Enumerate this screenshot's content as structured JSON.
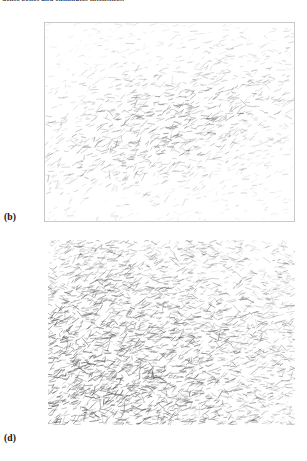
{
  "figure": {
    "caption_top": "dense zones and eliminates intensities.",
    "background_color": "#ffffff",
    "ink_color": "#555555",
    "border_color": "#c9c9c9"
  },
  "panels": [
    {
      "key": "b",
      "label": "(b)",
      "bordered": true,
      "x": 44,
      "y": 22,
      "width": 251,
      "height": 200
    },
    {
      "key": "d",
      "label": "(d)",
      "bordered": false,
      "x": 48,
      "y": 240,
      "width": 247,
      "height": 185
    }
  ],
  "chart_data": [
    {
      "id": "panel-b",
      "type": "scatter",
      "title": "(b)",
      "xlabel": "",
      "ylabel": "",
      "grid": false,
      "legend": null,
      "glyph": "line-segment",
      "description": "Sparse quiver / vector field of short line segments on white, faint grey ink, with an elongated denser and darker diagonal band running from lower-left to upper-right through the centre of the frame.",
      "xlim": [
        0,
        251
      ],
      "ylim": [
        0,
        200
      ],
      "n_segments": 1450,
      "density_field": {
        "model": "anisotropic-gaussian-band",
        "center_x": 0.47,
        "center_y": 0.52,
        "sigma_major": 0.4,
        "sigma_minor": 0.2,
        "band_angle_deg": -22,
        "base_density": 0.22,
        "peak_density": 1.0
      },
      "orientation_field": {
        "mean_angle_deg": -20,
        "angle_spread_deg": 46
      },
      "segment_length": {
        "min": 1.6,
        "max": 8.0,
        "mean": 4.2
      },
      "opacity": {
        "min": 0.1,
        "max": 0.72,
        "mean": 0.3
      },
      "stroke_width": {
        "min": 0.35,
        "max": 0.85
      },
      "seed": 20517
    },
    {
      "id": "panel-d",
      "type": "scatter",
      "title": "(d)",
      "xlabel": "",
      "ylabel": "",
      "grid": false,
      "legend": null,
      "glyph": "line-segment",
      "description": "Dense quiver / vector field of short line segments filling the whole frame, markedly darker and more crowded than panel (b); strongest concentration along the left edge and lower-left corner, thinning toward the upper-right.",
      "xlim": [
        0,
        247
      ],
      "ylim": [
        0,
        185
      ],
      "n_segments": 3200,
      "density_field": {
        "model": "left-weighted-gradient",
        "center_x": 0.1,
        "center_y": 0.78,
        "sigma_major": 0.62,
        "sigma_minor": 0.55,
        "band_angle_deg": -8,
        "base_density": 0.55,
        "peak_density": 1.0
      },
      "orientation_field": {
        "mean_angle_deg": -12,
        "angle_spread_deg": 55
      },
      "segment_length": {
        "min": 1.5,
        "max": 9.0,
        "mean": 4.6
      },
      "opacity": {
        "min": 0.14,
        "max": 0.88,
        "mean": 0.4
      },
      "stroke_width": {
        "min": 0.35,
        "max": 0.95
      },
      "seed": 80413
    }
  ]
}
